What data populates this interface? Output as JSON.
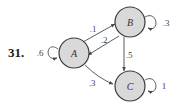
{
  "problem_number": "31.",
  "nodes": [
    {
      "id": "A",
      "label": "A",
      "self_loop": ".6"
    },
    {
      "id": "B",
      "label": "B",
      "self_loop": ".3"
    },
    {
      "id": "C",
      "label": "C",
      "self_loop": "1"
    }
  ],
  "edges": [
    {
      "from": "A",
      "to": "B",
      "label": ".1"
    },
    {
      "from": "B",
      "to": "A",
      "label": ".2"
    },
    {
      "from": "B",
      "to": "C",
      "label": ".5"
    },
    {
      "from": "A",
      "to": "C",
      "label": ".3"
    }
  ],
  "colors": {
    "node_fill": "#d9d9d9",
    "node_stroke": "#3a3a3a",
    "edge": "#4a4a4a"
  }
}
